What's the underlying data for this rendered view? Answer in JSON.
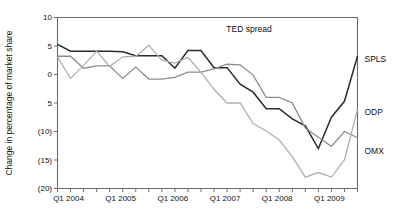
{
  "chart_data": {
    "type": "line",
    "title": "",
    "annotation": "TED spread",
    "xlabel": "",
    "ylabel": "Change in percentage of market share",
    "ylim": [
      -20,
      10
    ],
    "ytick_values": [
      10,
      5,
      0,
      -5,
      -10,
      -15,
      -20
    ],
    "ytick_labels": [
      "10",
      "5",
      "0",
      "5",
      "(10)",
      "(15)",
      "(20)"
    ],
    "grid": false,
    "legend_position": "right-outside",
    "x": [
      "Q1 2004",
      "Q2 2004",
      "Q3 2004",
      "Q4 2004",
      "Q1 2005",
      "Q2 2005",
      "Q3 2005",
      "Q4 2005",
      "Q1 2006",
      "Q2 2006",
      "Q3 2006",
      "Q4 2006",
      "Q1 2007",
      "Q2 2007",
      "Q3 2007",
      "Q4 2007",
      "Q1 2008",
      "Q2 2008",
      "Q3 2008",
      "Q4 2008",
      "Q1 2009",
      "Q2 2009",
      "Q3 2009",
      "Q4 2009"
    ],
    "xtick_labels": [
      "Q1 2004",
      "Q1 2005",
      "Q1 2006",
      "Q1 2007",
      "Q1 2008",
      "Q1 2009"
    ],
    "xtick_label_indices": [
      0,
      4,
      8,
      12,
      16,
      20
    ],
    "series": [
      {
        "name": "SPLS",
        "color": "#2b2b2b",
        "width": 1.5,
        "values": [
          5.3,
          4.1,
          4.1,
          4.1,
          4.1,
          4.0,
          3.3,
          3.3,
          3.3,
          1.1,
          4.2,
          4.2,
          1.2,
          1.2,
          -1.7,
          -3.1,
          -6.0,
          -6.0,
          -7.8,
          -9.0,
          -13.0,
          -7.5,
          -4.7,
          3.2
        ]
      },
      {
        "name": "ODP",
        "color": "#8c8c8c",
        "width": 1.3,
        "values": [
          3.2,
          3.2,
          1.1,
          1.5,
          1.5,
          -0.7,
          1.3,
          -0.8,
          -0.8,
          -0.5,
          0.4,
          0.4,
          1.0,
          1.8,
          1.7,
          -0.1,
          -4.0,
          -4.0,
          -5.0,
          -9.4,
          -11.0,
          -12.6,
          -10.0,
          -11.1
        ]
      },
      {
        "name": "OMX",
        "color": "#b0b0b0",
        "width": 1.3,
        "values": [
          3.1,
          -0.7,
          1.6,
          4.1,
          1.4,
          3.1,
          3.2,
          5.1,
          2.5,
          2.0,
          3.0,
          0.4,
          -2.6,
          -5.0,
          -5.0,
          -8.6,
          -9.9,
          -11.5,
          -14.4,
          -18.0,
          -17.2,
          -18.0,
          -15.0,
          -6.1
        ]
      }
    ]
  },
  "labels": {
    "y_axis_title": "Change in percentage of market share",
    "annotation": "TED spread"
  }
}
